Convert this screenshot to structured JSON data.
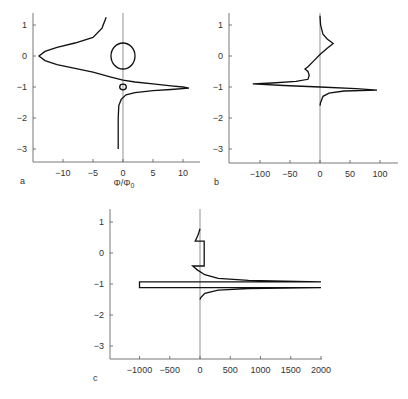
{
  "chart_data": [
    {
      "id": "a",
      "type": "line",
      "panel_label": "a",
      "xlabel": "Φ/Φ0",
      "xlabel_main": "Φ/Φ",
      "xlabel_sub": "0",
      "ylabel": "",
      "xlim": [
        -15,
        13
      ],
      "ylim": [
        -3.4,
        1.4
      ],
      "xticks": [
        -10,
        -5,
        0,
        5,
        10
      ],
      "xtick_labels": [
        "−10",
        "−5",
        "0",
        "5",
        "10"
      ],
      "yticks": [
        1,
        0,
        -1,
        -2,
        -3
      ],
      "ytick_labels": [
        "1",
        "0",
        "−1",
        "−2",
        "−3"
      ],
      "series": [
        {
          "name": "main-curve",
          "points": [
            [
              -2.8,
              1.25
            ],
            [
              -3.5,
              0.9
            ],
            [
              -5,
              0.6
            ],
            [
              -8,
              0.42
            ],
            [
              -11,
              0.28
            ],
            [
              -13,
              0.15
            ],
            [
              -14,
              0
            ],
            [
              -13,
              -0.15
            ],
            [
              -11,
              -0.28
            ],
            [
              -8,
              -0.4
            ],
            [
              -5,
              -0.52
            ],
            [
              -2,
              -0.68
            ],
            [
              0,
              -0.78
            ],
            [
              2,
              -0.84
            ],
            [
              5,
              -0.9
            ],
            [
              8,
              -0.96
            ],
            [
              10,
              -1.0
            ],
            [
              11,
              -1.04
            ],
            [
              8,
              -1.08
            ],
            [
              5,
              -1.12
            ],
            [
              2,
              -1.18
            ],
            [
              0.5,
              -1.25
            ],
            [
              -0.3,
              -1.4
            ],
            [
              -0.7,
              -1.6
            ],
            [
              -0.8,
              -2.0
            ],
            [
              -0.8,
              -3.0
            ]
          ]
        },
        {
          "name": "large-circle",
          "center": [
            0,
            0
          ],
          "radius_x": 2.0,
          "radius_y": 0.42
        },
        {
          "name": "small-circle",
          "center": [
            0,
            -1.0
          ],
          "radius_x": 0.55,
          "radius_y": 0.09
        }
      ]
    },
    {
      "id": "b",
      "type": "line",
      "panel_label": "b",
      "xlabel": "",
      "ylabel": "",
      "xlim": [
        -150,
        130
      ],
      "ylim": [
        -3.4,
        1.4
      ],
      "xticks": [
        -100,
        -50,
        0,
        50,
        100
      ],
      "xtick_labels": [
        "−100",
        "−50",
        "0",
        "50",
        "100"
      ],
      "yticks": [
        1,
        0,
        -1,
        -2,
        -3
      ],
      "ytick_labels": [
        "1",
        "0",
        "−1",
        "−2",
        "−3"
      ],
      "series": [
        {
          "name": "main-curve",
          "points": [
            [
              0,
              1.3
            ],
            [
              1,
              1.0
            ],
            [
              5,
              0.7
            ],
            [
              12,
              0.55
            ],
            [
              22,
              0.4
            ],
            [
              12,
              0.25
            ],
            [
              0,
              0.05
            ],
            [
              -10,
              -0.15
            ],
            [
              -20,
              -0.35
            ],
            [
              -25,
              -0.42
            ],
            [
              -20,
              -0.5
            ],
            [
              -18,
              -0.62
            ],
            [
              -20,
              -0.75
            ],
            [
              -40,
              -0.82
            ],
            [
              -80,
              -0.87
            ],
            [
              -112,
              -0.9
            ],
            [
              -60,
              -0.95
            ],
            [
              0,
              -1.0
            ],
            [
              60,
              -1.05
            ],
            [
              95,
              -1.1
            ],
            [
              40,
              -1.13
            ],
            [
              15,
              -1.2
            ],
            [
              5,
              -1.3
            ],
            [
              1,
              -1.5
            ],
            [
              0,
              -1.6
            ]
          ]
        }
      ]
    },
    {
      "id": "c",
      "type": "line",
      "panel_label": "c",
      "xlabel": "",
      "ylabel": "",
      "xlim": [
        -1500,
        2000
      ],
      "ylim": [
        -3.4,
        1.4
      ],
      "xticks": [
        -1000,
        -500,
        0,
        500,
        1000,
        1500,
        2000
      ],
      "xtick_labels": [
        "−1000",
        "−500",
        "0",
        "500",
        "1000",
        "1500",
        "2000"
      ],
      "yticks": [
        1,
        0,
        -1,
        -2,
        -3
      ],
      "ytick_labels": [
        "1",
        "0",
        "−1",
        "−2",
        "−3"
      ],
      "series": [
        {
          "name": "main-curve",
          "points": [
            [
              0,
              0.78
            ],
            [
              -20,
              0.65
            ],
            [
              -40,
              0.55
            ],
            [
              -80,
              0.38
            ],
            [
              70,
              0.38
            ],
            [
              70,
              -0.42
            ],
            [
              -120,
              -0.42
            ],
            [
              -40,
              -0.55
            ],
            [
              80,
              -0.7
            ],
            [
              300,
              -0.82
            ],
            [
              800,
              -0.88
            ],
            [
              2000,
              -0.93
            ],
            [
              -1000,
              -0.93
            ],
            [
              -1000,
              -1.12
            ],
            [
              2000,
              -1.12
            ],
            [
              800,
              -1.15
            ],
            [
              300,
              -1.2
            ],
            [
              80,
              -1.3
            ],
            [
              10,
              -1.45
            ],
            [
              0,
              -1.5
            ]
          ]
        }
      ]
    }
  ]
}
